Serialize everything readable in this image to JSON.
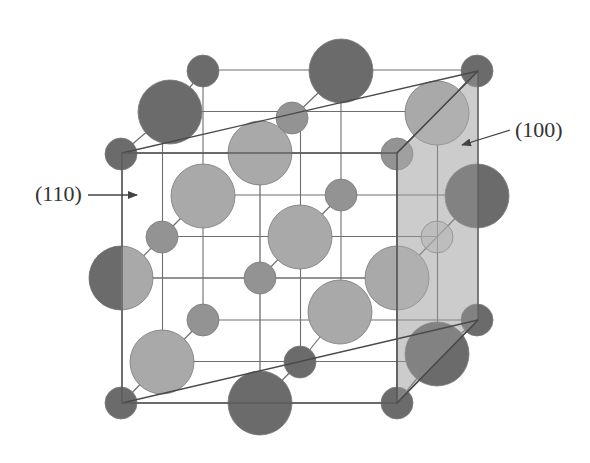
{
  "figure": {
    "labels": {
      "plane_110": "(110)",
      "plane_100": "(100)"
    }
  },
  "colors": {
    "background": "#ffffff",
    "line": "#6e6e6e",
    "edge": "#5a5a5a",
    "atom_light": "#a9a9a9",
    "atom_medium": "#939393",
    "atom_dark": "#6b6b6b",
    "plane_fill": "#c6c6c6",
    "plane_edge": "#4a4a4a",
    "arrow": "#444444"
  },
  "cube": {
    "front": {
      "x": [
        122,
        260,
        397
      ],
      "y": [
        153,
        278,
        403
      ]
    },
    "offset": {
      "dx": 81,
      "dy": -83
    }
  },
  "plane_100": {
    "points": [
      [
        397,
        153
      ],
      [
        478,
        71
      ],
      [
        478,
        320
      ],
      [
        397,
        403
      ]
    ]
  },
  "plane_110": {
    "lines": [
      [
        [
          122,
          153
        ],
        [
          478,
          71
        ]
      ],
      [
        [
          122,
          403
        ],
        [
          478,
          320
        ]
      ]
    ]
  },
  "bonds": [
    [
      [
        122,
        153
      ],
      [
        170,
        112
      ]
    ],
    [
      [
        170,
        112
      ],
      [
        203,
        71
      ]
    ],
    [
      [
        162,
        237
      ],
      [
        203,
        196
      ]
    ],
    [
      [
        122,
        278
      ],
      [
        162,
        237
      ]
    ],
    [
      [
        162,
        362
      ],
      [
        203,
        320
      ]
    ],
    [
      [
        122,
        403
      ],
      [
        162,
        362
      ]
    ],
    [
      [
        260,
        153
      ],
      [
        292,
        118
      ]
    ],
    [
      [
        292,
        118
      ],
      [
        341,
        71
      ]
    ],
    [
      [
        260,
        278
      ],
      [
        300,
        237
      ]
    ],
    [
      [
        300,
        237
      ],
      [
        341,
        195
      ]
    ],
    [
      [
        260,
        403
      ],
      [
        300,
        362
      ]
    ],
    [
      [
        300,
        362
      ],
      [
        340,
        312
      ]
    ],
    [
      [
        397,
        153
      ],
      [
        437,
        113
      ]
    ],
    [
      [
        437,
        113
      ],
      [
        477,
        71
      ]
    ],
    [
      [
        397,
        278
      ],
      [
        437,
        237
      ]
    ],
    [
      [
        437,
        237
      ],
      [
        477,
        196
      ]
    ],
    [
      [
        397,
        403
      ],
      [
        437,
        354
      ]
    ],
    [
      [
        437,
        354
      ],
      [
        477,
        320
      ]
    ]
  ],
  "atoms": [
    {
      "id": "back-tl",
      "x": 203,
      "y": 71,
      "r": 16,
      "tone": "dark",
      "layer": 0
    },
    {
      "id": "back-tm",
      "x": 341,
      "y": 71,
      "r": 32,
      "tone": "dark",
      "layer": 0
    },
    {
      "id": "back-tr",
      "x": 477,
      "y": 71,
      "r": 16,
      "tone": "dark",
      "layer": 0
    },
    {
      "id": "back-ml",
      "x": 203,
      "y": 196,
      "r": 32,
      "tone": "light",
      "layer": 0
    },
    {
      "id": "back-c",
      "x": 341,
      "y": 195,
      "r": 16,
      "tone": "medium",
      "layer": 0
    },
    {
      "id": "back-mr",
      "x": 477,
      "y": 196,
      "r": 32,
      "tone": "dark",
      "layer": 0
    },
    {
      "id": "back-bl",
      "x": 203,
      "y": 320,
      "r": 16,
      "tone": "medium",
      "layer": 0
    },
    {
      "id": "back-bm",
      "x": 340,
      "y": 312,
      "r": 32,
      "tone": "light",
      "layer": 0
    },
    {
      "id": "back-br",
      "x": 477,
      "y": 320,
      "r": 16,
      "tone": "dark",
      "layer": 0
    },
    {
      "id": "mid-tl",
      "x": 170,
      "y": 112,
      "r": 32,
      "tone": "dark",
      "layer": 1
    },
    {
      "id": "mid-tm",
      "x": 292,
      "y": 118,
      "r": 16,
      "tone": "medium",
      "layer": 1
    },
    {
      "id": "mid-tr",
      "x": 437,
      "y": 113,
      "r": 32,
      "tone": "light",
      "layer": 1
    },
    {
      "id": "mid-ml",
      "x": 162,
      "y": 237,
      "r": 16,
      "tone": "medium",
      "layer": 1
    },
    {
      "id": "mid-c",
      "x": 300,
      "y": 237,
      "r": 32,
      "tone": "light",
      "layer": 1
    },
    {
      "id": "mid-mr",
      "x": 437,
      "y": 237,
      "r": 16,
      "tone": "ghost",
      "layer": 1
    },
    {
      "id": "mid-bl",
      "x": 162,
      "y": 362,
      "r": 32,
      "tone": "light",
      "layer": 1
    },
    {
      "id": "mid-bm",
      "x": 300,
      "y": 362,
      "r": 16,
      "tone": "dark",
      "layer": 1
    },
    {
      "id": "mid-br",
      "x": 437,
      "y": 354,
      "r": 32,
      "tone": "dark",
      "layer": 1
    },
    {
      "id": "front-tl",
      "x": 121,
      "y": 154,
      "r": 16,
      "tone": "dark",
      "layer": 2
    },
    {
      "id": "front-tm",
      "x": 260,
      "y": 153,
      "r": 32,
      "tone": "light",
      "layer": 2
    },
    {
      "id": "front-tr",
      "x": 397,
      "y": 154,
      "r": 16,
      "tone": "medium",
      "layer": 2
    },
    {
      "id": "front-ml",
      "x": 121,
      "y": 278,
      "r": 32,
      "tone": "half",
      "layer": 2
    },
    {
      "id": "front-c",
      "x": 260,
      "y": 278,
      "r": 16,
      "tone": "medium",
      "layer": 2
    },
    {
      "id": "front-mr",
      "x": 397,
      "y": 278,
      "r": 32,
      "tone": "light",
      "layer": 2
    },
    {
      "id": "front-bl",
      "x": 121,
      "y": 403,
      "r": 16,
      "tone": "dark",
      "layer": 2
    },
    {
      "id": "front-bm",
      "x": 260,
      "y": 403,
      "r": 32,
      "tone": "dark",
      "layer": 2
    },
    {
      "id": "front-br",
      "x": 397,
      "y": 403,
      "r": 16,
      "tone": "dark",
      "layer": 2
    }
  ],
  "arrows": [
    {
      "name": "arrow-110",
      "from": [
        88,
        195
      ],
      "to": [
        137,
        195
      ]
    },
    {
      "name": "arrow-100",
      "from": [
        510,
        130
      ],
      "to": [
        462,
        145
      ]
    }
  ]
}
